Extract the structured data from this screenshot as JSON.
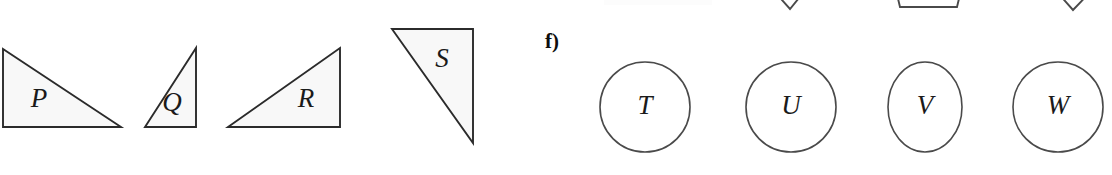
{
  "figure": {
    "width": 1112,
    "height": 175,
    "background": "#ffffff",
    "outline_color": "#2b2b2b",
    "fill_color": "#f8f8f8",
    "open_stroke_color": "#4a4a4a",
    "label_color": "#1a1a1a"
  },
  "part_label": {
    "text": "f)",
    "x": 545,
    "y": 31
  },
  "triangles": [
    {
      "label": "P",
      "points": "3,49 3,127 121,127",
      "label_x": 39,
      "label_y": 101
    },
    {
      "label": "Q",
      "points": "196,48 196,127 145,127",
      "label_x": 172,
      "label_y": 105
    },
    {
      "label": "R",
      "points": "340,48 340,127 228,127",
      "label_x": 306,
      "label_y": 101
    },
    {
      "label": "S",
      "points": "392,29 473,29 473,143",
      "label_x": 442,
      "label_y": 61
    }
  ],
  "circles": [
    {
      "label": "T",
      "cx": 645,
      "cy": 107,
      "rx": 45,
      "ry": 45
    },
    {
      "label": "U",
      "cx": 791,
      "cy": 107,
      "rx": 45,
      "ry": 45
    },
    {
      "label": "V",
      "cx": 925,
      "cy": 107,
      "rx": 37,
      "ry": 45
    },
    {
      "label": "W",
      "cx": 1058,
      "cy": 107,
      "rx": 45,
      "ry": 45
    }
  ],
  "clipped_shapes": [
    {
      "name": "chevron-bottom-left",
      "points": "600,-20 600,0 700,0 700,-20"
    },
    {
      "name": "chevron-bottom-mid",
      "points": "766,-18 790,9 812,-18"
    },
    {
      "name": "trapezoid-bottom",
      "points": "894,-18 900,7 957,7 963,-18"
    },
    {
      "name": "chevron-bottom-right",
      "points": "1050,-16 1073,10 1098,-16"
    }
  ]
}
